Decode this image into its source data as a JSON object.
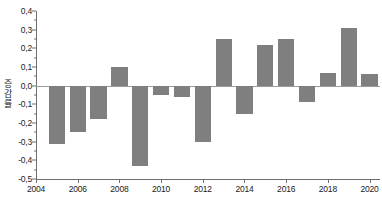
{
  "chart_data": {
    "type": "bar",
    "title": "",
    "xlabel": "",
    "ylabel": "증감률",
    "ylabel_chars": [
      "증",
      "감",
      "률"
    ],
    "ylim": [
      -0.5,
      0.4
    ],
    "xlim": [
      2004,
      2020.5
    ],
    "grid": false,
    "legend": null,
    "bar_color": "#7f7f7f",
    "axis_color": "#6e6e6e",
    "ytick_labels": [
      "0,4",
      "0,3",
      "0,2",
      "0,1",
      "0,0",
      "-0,1",
      "-0,2",
      "-0,3",
      "-0,4",
      "-0,5"
    ],
    "ytick_values": [
      0.4,
      0.3,
      0.2,
      0.1,
      0.0,
      -0.1,
      -0.2,
      -0.3,
      -0.4,
      -0.5
    ],
    "xtick_labels": [
      "2004",
      "2006",
      "2008",
      "2010",
      "2012",
      "2014",
      "2016",
      "2018",
      "2020"
    ],
    "xtick_values": [
      2004,
      2006,
      2008,
      2010,
      2012,
      2014,
      2016,
      2018,
      2020
    ],
    "categories": [
      2005,
      2006,
      2007,
      2008,
      2009,
      2010,
      2011,
      2012,
      2013,
      2014,
      2015,
      2016,
      2017,
      2018,
      2019,
      2020
    ],
    "values": [
      -0.31,
      -0.25,
      -0.18,
      0.1,
      -0.43,
      -0.05,
      -0.06,
      -0.3,
      0.25,
      -0.15,
      0.22,
      0.25,
      -0.09,
      0.07,
      0.31,
      0.06
    ]
  }
}
